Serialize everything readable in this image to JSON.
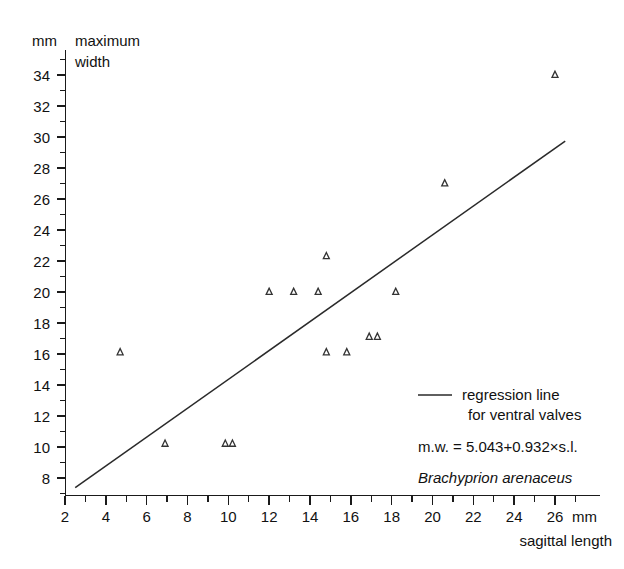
{
  "chart_data": {
    "type": "scatter",
    "title": "",
    "xlabel": "sagittal length",
    "ylabel": "maximum width",
    "x_unit": "mm",
    "y_unit": "mm",
    "xlim": [
      2,
      27
    ],
    "ylim": [
      7,
      35
    ],
    "x_ticks": [
      2,
      4,
      6,
      8,
      10,
      12,
      14,
      16,
      18,
      20,
      22,
      24,
      26
    ],
    "y_ticks": [
      8,
      10,
      12,
      14,
      16,
      18,
      20,
      22,
      24,
      26,
      28,
      30,
      32,
      34
    ],
    "x_minor_step": 1,
    "y_minor_step": 1,
    "grid": false,
    "legend_position": "bottom-right",
    "series": [
      {
        "name": "ventral valves",
        "marker": "triangle",
        "x": [
          4.7,
          6.9,
          9.85,
          10.2,
          12.0,
          13.2,
          14.4,
          14.8,
          14.8,
          15.8,
          16.9,
          17.3,
          18.2,
          20.6,
          26.0
        ],
        "y": [
          16.1,
          10.2,
          10.2,
          10.2,
          20.0,
          20.0,
          20.0,
          22.3,
          16.1,
          16.1,
          17.1,
          17.1,
          20.0,
          27.0,
          34.0
        ]
      }
    ],
    "regression": {
      "label_line1": "regression line",
      "label_line2": "for ventral valves",
      "equation": "m.w. = 5.043+0.932×s.l.",
      "intercept": 5.043,
      "slope": 0.932,
      "x_start": 2.5,
      "x_end": 26.5
    },
    "taxon": "Brachyprion arenaceus"
  },
  "axes": {
    "y_unit_label": "mm",
    "y_title_line1": "maximum",
    "y_title_line2": "width",
    "x_unit_label": "mm",
    "x_title": "sagittal length"
  },
  "legend": {
    "regression_line1": "regression line",
    "regression_line2": "for ventral valves",
    "equation": "m.w. = 5.043+0.932×s.l.",
    "taxon": "Brachyprion arenaceus"
  }
}
